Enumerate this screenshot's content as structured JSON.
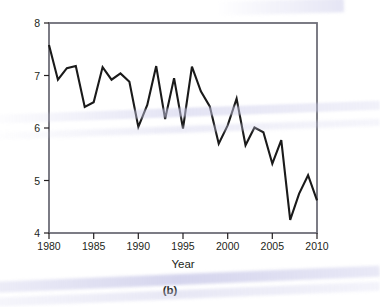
{
  "figure": {
    "caption": "(b)",
    "background_color": "#ffffff"
  },
  "axes": {
    "xlabel": "Year",
    "ylabel_main": "Extent of sea ice (million km",
    "ylabel_unit_sup": "2",
    "ylabel_close": ")",
    "ylabel_full": "Extent of sea ice (million km2)",
    "x_ticks": [
      "1980",
      "1985",
      "1990",
      "1995",
      "2000",
      "2005",
      "2010"
    ],
    "y_ticks": [
      "4",
      "5",
      "6",
      "7",
      "8"
    ],
    "frame_color": "#6e6e78",
    "line_color": "#1a1a1a"
  },
  "chart_data": {
    "type": "line",
    "title": "",
    "xlabel": "Year",
    "ylabel": "Extent of sea ice (million km2)",
    "xlim": [
      1980,
      2010
    ],
    "ylim": [
      4,
      8
    ],
    "xticks": [
      1980,
      1985,
      1990,
      1995,
      2000,
      2005,
      2010
    ],
    "yticks": [
      4,
      5,
      6,
      7,
      8
    ],
    "grid": false,
    "legend": "none",
    "line_color": "#1a1a1a",
    "x": [
      1980,
      1981,
      1982,
      1983,
      1984,
      1985,
      1986,
      1987,
      1988,
      1989,
      1990,
      1991,
      1992,
      1993,
      1994,
      1995,
      1996,
      1997,
      1998,
      1999,
      2000,
      2001,
      2002,
      2003,
      2004,
      2005,
      2006,
      2007,
      2008,
      2009,
      2010
    ],
    "values": [
      7.58,
      6.92,
      7.14,
      7.18,
      6.4,
      6.49,
      7.16,
      6.92,
      7.04,
      6.88,
      6.02,
      6.44,
      7.18,
      6.17,
      6.95,
      5.99,
      7.17,
      6.7,
      6.41,
      5.7,
      6.05,
      6.56,
      5.67,
      6.01,
      5.92,
      5.32,
      5.77,
      4.25,
      4.75,
      5.1,
      4.62
    ]
  }
}
